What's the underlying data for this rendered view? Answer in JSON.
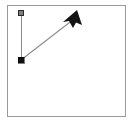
{
  "canvas": {
    "name": "drawing-canvas",
    "width": 137,
    "height": 128,
    "background_color": "#ffffff",
    "frame": {
      "x": 7,
      "y": 5,
      "width": 119,
      "height": 112,
      "border_color": "#9a9a9a",
      "border_width": 1
    }
  },
  "shapes": {
    "vertical_line": {
      "label": "vertical reference line",
      "x1": 21,
      "y1": 13,
      "x2": 21,
      "y2": 60,
      "color": "#8c8c8c",
      "width": 1
    },
    "diagonal_line": {
      "label": "diagonal vector line",
      "x1": 21,
      "y1": 60,
      "x2": 76,
      "y2": 18,
      "color": "#8c8c8c",
      "width": 1
    },
    "arrowhead": {
      "label": "arrow head",
      "points": "71,12 81,22 75,22 76,28 70,22 65,23",
      "color": "#121212",
      "tip_x": 76,
      "tip_y": 14
    }
  },
  "handles": {
    "top_handle": {
      "label": "top end handle",
      "x": 21,
      "y": 13,
      "size": 5,
      "fill_color": "#7d7d7d",
      "stroke_color": "#2b2b2b",
      "state": "unselected"
    },
    "origin_handle": {
      "label": "origin vertex handle",
      "x": 21,
      "y": 60,
      "size": 6,
      "fill_color": "#111111",
      "stroke_color": "#000000",
      "state": "selected"
    }
  }
}
